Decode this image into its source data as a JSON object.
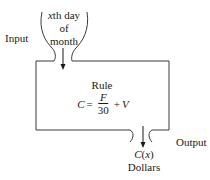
{
  "diagram": {
    "input": {
      "label": "Input",
      "lines": [
        "xth day",
        "of",
        "month"
      ],
      "italic_prefix": "x",
      "line0_rest": "th day"
    },
    "rule": {
      "title": "Rule",
      "formula": {
        "lhs": "C",
        "equals": "=",
        "numerator": "F",
        "denominator": "30",
        "plus": "+",
        "addend": "V"
      }
    },
    "output": {
      "label": "Output",
      "value": "C(x)",
      "value_func": "C",
      "value_arg": "x",
      "unit": "Dollars"
    },
    "colors": {
      "stroke": "#3a3a3a",
      "text": "#1a1a1a",
      "background": "#ffffff"
    }
  }
}
